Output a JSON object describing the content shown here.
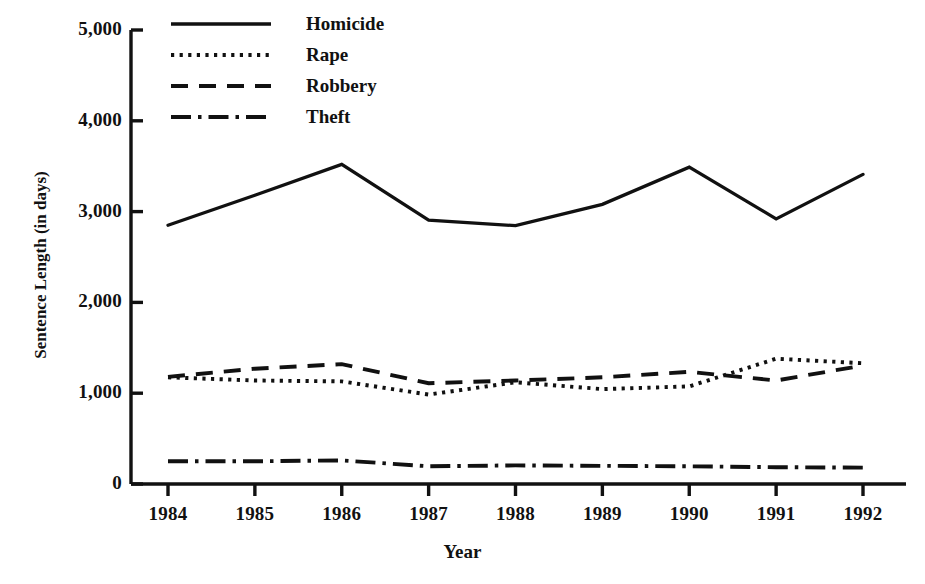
{
  "chart_data": {
    "type": "line",
    "title": "",
    "xlabel": "Year",
    "ylabel": "Sentence Length (in days)",
    "x": [
      1984,
      1985,
      1986,
      1987,
      1988,
      1989,
      1990,
      1991,
      1992
    ],
    "xtick_labels": [
      "1984",
      "1985",
      "1986",
      "1987",
      "1988",
      "1989",
      "1990",
      "1991",
      "1992"
    ],
    "ytick_labels": [
      "0",
      "1,000",
      "2,000",
      "3,000",
      "4,000",
      "5,000"
    ],
    "yticks": [
      0,
      1000,
      2000,
      3000,
      4000,
      5000
    ],
    "ylim": [
      0,
      5000
    ],
    "xlim": [
      1984,
      1992
    ],
    "grid": false,
    "legend_position": "top-left-inside",
    "series": [
      {
        "name": "Homicide",
        "dash": "solid",
        "values": [
          2850,
          3180,
          3520,
          2905,
          2845,
          3080,
          3490,
          2920,
          3410
        ]
      },
      {
        "name": "Rape",
        "dash": "dotted",
        "values": [
          1175,
          1140,
          1130,
          985,
          1120,
          1045,
          1075,
          1380,
          1330
        ]
      },
      {
        "name": "Robbery",
        "dash": "dashed",
        "values": [
          1180,
          1270,
          1320,
          1110,
          1140,
          1175,
          1235,
          1140,
          1305
        ]
      },
      {
        "name": "Theft",
        "dash": "dash-dot",
        "values": [
          250,
          250,
          260,
          195,
          205,
          200,
          195,
          185,
          180
        ]
      }
    ]
  },
  "legend": {
    "items": [
      {
        "label": "Homicide",
        "key": "solid-line-key"
      },
      {
        "label": "Rape",
        "key": "dotted-line-key"
      },
      {
        "label": "Robbery",
        "key": "dashed-line-key"
      },
      {
        "label": "Theft",
        "key": "dash-dot-line-key"
      }
    ]
  },
  "axes": {
    "y_title": "Sentence Length (in days)",
    "x_title": "Year",
    "y_ticks": [
      "5,000",
      "4,000",
      "3,000",
      "2,000",
      "1,000",
      "0"
    ],
    "x_ticks": [
      "1984",
      "1985",
      "1986",
      "1987",
      "1988",
      "1989",
      "1990",
      "1991",
      "1992"
    ]
  },
  "colors": {
    "ink": "#111111",
    "background": "#ffffff"
  }
}
